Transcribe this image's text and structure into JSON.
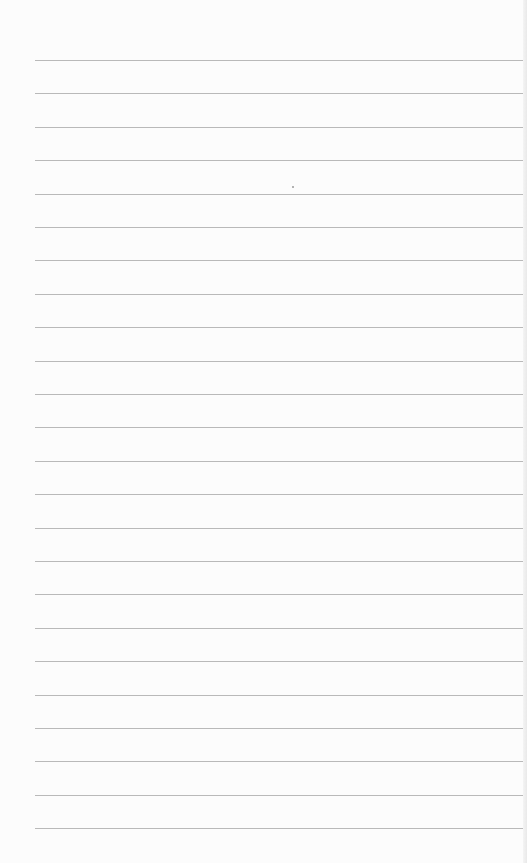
{
  "page": {
    "type": "lined-paper",
    "background_color": "#fcfcfc",
    "line_color": "#b9b9b9",
    "line_count": 24,
    "first_line_y": 60,
    "line_spacing": 33.4,
    "line_left": 35,
    "line_width": 488,
    "text": ""
  },
  "marks": [
    {
      "x": 292,
      "y": 186
    }
  ]
}
